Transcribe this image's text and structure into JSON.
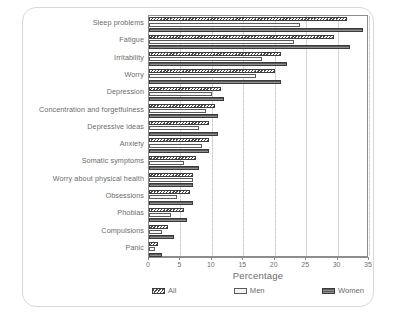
{
  "chart_data": {
    "type": "bar",
    "orientation": "horizontal",
    "title": "",
    "subtitle": "",
    "xlabel": "Percentage",
    "ylabel": "",
    "xlim": [
      0,
      35
    ],
    "xticks": [
      0,
      5,
      10,
      15,
      20,
      25,
      30,
      35
    ],
    "xtick_labels": [
      "0",
      "5",
      "10",
      "15",
      "20",
      "25",
      "30",
      "35"
    ],
    "grid": "vertical-dotted",
    "legend_position": "bottom",
    "categories": [
      "Sleep problems",
      "Fatigue",
      "Irritability",
      "Worry",
      "Depression",
      "Concentration and forgetfulness",
      "Depressive ideas",
      "Anxiety",
      "Somatic symptoms",
      "Worry about physical health",
      "Obsessions",
      "Phobias",
      "Compulsions",
      "Panic"
    ],
    "series": [
      {
        "name": "All",
        "pattern": "diagonal-hatch",
        "values": [
          31.5,
          29.5,
          21.0,
          20.0,
          11.5,
          10.5,
          9.5,
          9.5,
          7.5,
          7.0,
          6.5,
          5.5,
          3.0,
          1.5
        ]
      },
      {
        "name": "Men",
        "pattern": "light-open",
        "values": [
          24.0,
          23.0,
          18.0,
          17.0,
          10.0,
          9.0,
          8.0,
          8.5,
          5.5,
          7.0,
          4.5,
          3.5,
          2.0,
          1.0
        ]
      },
      {
        "name": "Women",
        "pattern": "dark-hatch",
        "values": [
          34.0,
          32.0,
          22.0,
          21.0,
          12.0,
          11.0,
          11.0,
          9.5,
          8.0,
          7.0,
          7.0,
          6.0,
          4.0,
          2.0
        ]
      }
    ]
  },
  "axis": {
    "x_title": "Percentage"
  },
  "legend": {
    "items": [
      {
        "label": "All"
      },
      {
        "label": "Men"
      },
      {
        "label": "Women"
      }
    ]
  },
  "colors": {
    "all": "#4a4a4a",
    "men": "#f2f2f2",
    "women": "#7e7e7e",
    "axis": "#8d8d8d",
    "grid": "#d0d0d0",
    "text": "#6b6b6b",
    "frame": "#d8d8d8"
  }
}
